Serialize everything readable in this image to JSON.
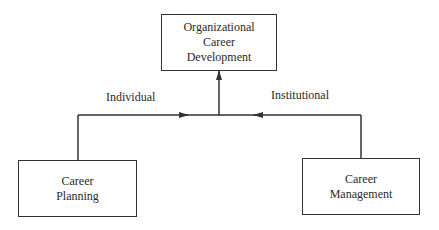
{
  "diagram": {
    "top_box": {
      "lines": [
        "Organizational",
        "Career",
        "Development"
      ]
    },
    "left_box": {
      "lines": [
        "Career",
        "Planning"
      ]
    },
    "right_box": {
      "lines": [
        "Career",
        "Management"
      ]
    },
    "labels": {
      "left_edge": "Individual",
      "right_edge": "Institutional"
    },
    "edges": [
      {
        "from": "Career Planning",
        "to": "junction",
        "label": "Individual"
      },
      {
        "from": "Career Management",
        "to": "junction",
        "label": "Institutional"
      },
      {
        "from": "junction",
        "to": "Organizational Career Development"
      }
    ],
    "colors": {
      "line": "#333333",
      "text": "#2a2a2a",
      "background": "#ffffff"
    }
  }
}
